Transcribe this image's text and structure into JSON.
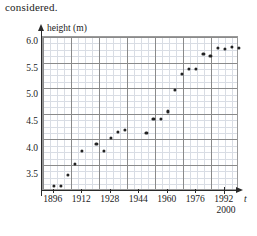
{
  "intro_text": "considered.",
  "chart_data": {
    "type": "scatter",
    "title": "",
    "xlabel": "t",
    "ylabel": "height (m)",
    "xlim": [
      1890,
      2000
    ],
    "ylim": [
      3.2,
      6.1
    ],
    "xticks": [
      1896,
      1912,
      1928,
      1944,
      1960,
      1976,
      1992
    ],
    "xtick_labels": [
      "1896",
      "1912",
      "1928",
      "1944",
      "1960",
      "1976",
      "1992"
    ],
    "extra_xtick": 2000,
    "extra_xtick_label": "2000",
    "yticks": [
      3.5,
      4.0,
      4.5,
      5.0,
      5.5,
      6.0
    ],
    "ytick_labels": [
      "3.5",
      "4.0",
      "4.5",
      "5.0",
      "5.5",
      "6.0"
    ],
    "grid": true,
    "grid_minor": true,
    "legend": false,
    "marker_color": "#232323",
    "axis_color": "#2a2a2a",
    "grid_major_color": "#8a8a8a",
    "grid_minor_color": "#d9dde4",
    "x": [
      1896,
      1900,
      1904,
      1908,
      1912,
      1920,
      1924,
      1928,
      1932,
      1936,
      1948,
      1952,
      1956,
      1960,
      1964,
      1968,
      1972,
      1976,
      1980,
      1984,
      1988,
      1992,
      1996,
      2000
    ],
    "y": [
      3.3,
      3.3,
      3.5,
      3.71,
      3.95,
      4.09,
      3.95,
      4.2,
      4.31,
      4.35,
      4.3,
      4.55,
      4.56,
      4.7,
      5.1,
      5.4,
      5.5,
      5.5,
      5.78,
      5.75,
      5.9,
      5.87,
      5.92,
      5.9
    ]
  }
}
